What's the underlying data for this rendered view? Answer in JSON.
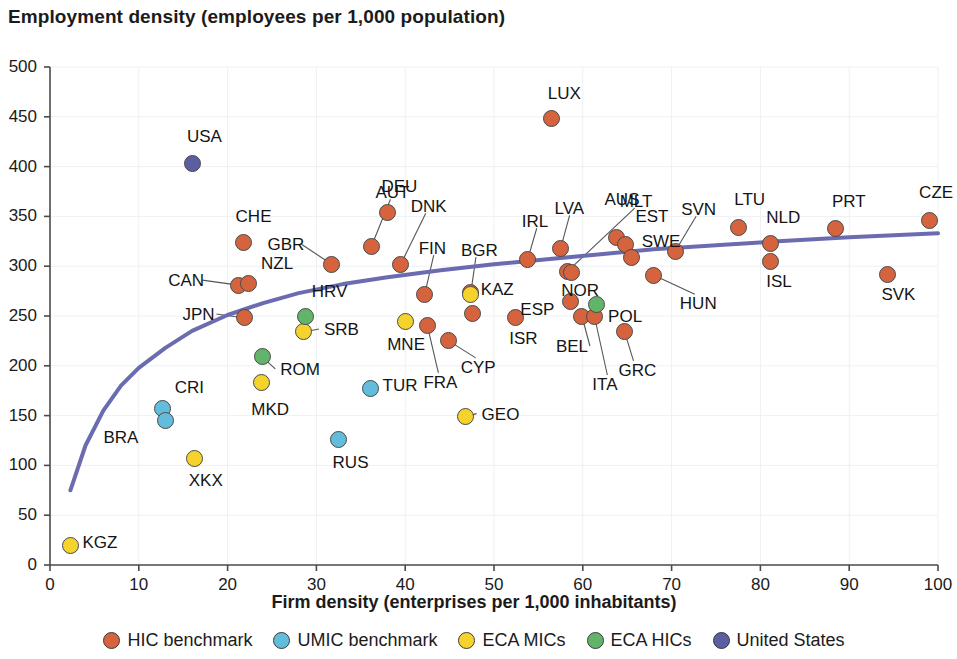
{
  "chart_data": {
    "type": "scatter",
    "title": "Employment density (employees per 1,000 population)",
    "xlabel": "Firm density (enterprises per 1,000 inhabitants)",
    "ylabel": "Employment density (employees per 1,000 population)",
    "xlim": [
      0,
      100
    ],
    "ylim": [
      0,
      500
    ],
    "xticks": [
      0,
      10,
      20,
      30,
      40,
      50,
      60,
      70,
      80,
      90,
      100
    ],
    "yticks": [
      0,
      50,
      100,
      150,
      200,
      250,
      300,
      350,
      400,
      450,
      500
    ],
    "grid": true,
    "legend_position": "bottom",
    "legend": [
      {
        "name": "HIC benchmark",
        "color": "#d4633e"
      },
      {
        "name": "UMIC benchmark",
        "color": "#62bcdc"
      },
      {
        "name": "ECA MICs",
        "color": "#f5d32c"
      },
      {
        "name": "ECA HICs",
        "color": "#62b46a"
      },
      {
        "name": "United States",
        "color": "#5b5ea0"
      }
    ],
    "trendline": {
      "name": "fitted logarithmic trend",
      "color": "#6b6cb0",
      "points": [
        [
          2.3,
          75
        ],
        [
          4,
          120
        ],
        [
          6,
          155
        ],
        [
          8,
          180
        ],
        [
          10,
          198
        ],
        [
          13,
          218
        ],
        [
          16,
          235
        ],
        [
          20,
          251
        ],
        [
          24,
          263
        ],
        [
          28,
          273
        ],
        [
          33,
          282
        ],
        [
          38,
          289
        ],
        [
          44,
          296
        ],
        [
          50,
          302
        ],
        [
          56,
          307
        ],
        [
          62,
          312
        ],
        [
          68,
          317
        ],
        [
          75,
          321
        ],
        [
          82,
          325
        ],
        [
          90,
          329
        ],
        [
          100,
          333
        ]
      ]
    },
    "series": [
      {
        "name": "HIC benchmark",
        "color": "#d4633e",
        "points": [
          {
            "code": "CHE",
            "x": 21.8,
            "y": 324,
            "label_dx": -8,
            "label_dy": -26,
            "leader": false
          },
          {
            "code": "DEU",
            "x": 38.0,
            "y": 354,
            "label_dx": -6,
            "label_dy": -26,
            "leader": false
          },
          {
            "code": "AUT",
            "x": 36.2,
            "y": 320,
            "label_dx": 4,
            "label_dy": -54,
            "leader": true
          },
          {
            "code": "GBR",
            "x": 31.7,
            "y": 302,
            "label_dx": -64,
            "label_dy": -20,
            "leader": true
          },
          {
            "code": "DNK",
            "x": 39.5,
            "y": 302,
            "label_dx": 10,
            "label_dy": -58,
            "leader": true
          },
          {
            "code": "CAN",
            "x": 21.2,
            "y": 281,
            "label_dx": -70,
            "label_dy": -5,
            "leader": true
          },
          {
            "code": "NZL",
            "x": 22.3,
            "y": 283,
            "label_dx": 13,
            "label_dy": -20,
            "leader": false
          },
          {
            "code": "JPN",
            "x": 21.9,
            "y": 248,
            "label_dx": -62,
            "label_dy": -4,
            "leader": true
          },
          {
            "code": "FIN",
            "x": 42.2,
            "y": 272,
            "label_dx": -6,
            "label_dy": -46,
            "leader": true
          },
          {
            "code": "LUX",
            "x": 56.5,
            "y": 448,
            "label_dx": -4,
            "label_dy": -26,
            "leader": false
          },
          {
            "code": "IRL",
            "x": 53.8,
            "y": 307,
            "label_dx": -6,
            "label_dy": -38,
            "leader": true
          },
          {
            "code": "LVA",
            "x": 57.5,
            "y": 318,
            "label_dx": -6,
            "label_dy": -40,
            "leader": true
          },
          {
            "code": "MLT",
            "x": 58.3,
            "y": 295,
            "label_dx": 52,
            "label_dy": -70,
            "leader": true
          },
          {
            "code": "BGR",
            "x": 47.4,
            "y": 274,
            "label_dx": -10,
            "label_dy": -42,
            "leader": true
          },
          {
            "code": "AUS",
            "x": 63.8,
            "y": 329,
            "label_dx": -12,
            "label_dy": -38,
            "leader": false
          },
          {
            "code": "EST",
            "x": 64.8,
            "y": 322,
            "label_dx": 10,
            "label_dy": -28,
            "leader": false
          },
          {
            "code": "SWE",
            "x": 65.5,
            "y": 309,
            "label_dx": 10,
            "label_dy": -16,
            "leader": false
          },
          {
            "code": "SVN",
            "x": 70.4,
            "y": 315,
            "label_dx": 6,
            "label_dy": -42,
            "leader": true
          },
          {
            "code": "NOR",
            "x": 58.7,
            "y": 294,
            "label_dx": -10,
            "label_dy": 18,
            "leader": false
          },
          {
            "code": "LTU",
            "x": 77.5,
            "y": 339,
            "label_dx": -4,
            "label_dy": -28,
            "leader": false
          },
          {
            "code": "NLD",
            "x": 81.1,
            "y": 323,
            "label_dx": -4,
            "label_dy": -26,
            "leader": false
          },
          {
            "code": "ISL",
            "x": 81.1,
            "y": 305,
            "label_dx": -4,
            "label_dy": 20,
            "leader": false
          },
          {
            "code": "PRT",
            "x": 88.5,
            "y": 338,
            "label_dx": -4,
            "label_dy": -27,
            "leader": false
          },
          {
            "code": "CZE",
            "x": 99.0,
            "y": 346,
            "label_dx": -10,
            "label_dy": -28,
            "leader": false
          },
          {
            "code": "SVK",
            "x": 94.3,
            "y": 292,
            "label_dx": -6,
            "label_dy": 20,
            "leader": false
          },
          {
            "code": "HUN",
            "x": 68.0,
            "y": 291,
            "label_dx": 26,
            "label_dy": 28,
            "leader": true
          },
          {
            "code": "KAZ",
            "x": 47.6,
            "y": 253,
            "label_dx": 8,
            "label_dy": -24,
            "leader": false
          },
          {
            "code": "ISR",
            "x": 52.4,
            "y": 248,
            "label_dx": -6,
            "label_dy": 20,
            "leader": false
          },
          {
            "code": "ESP",
            "x": 58.6,
            "y": 265,
            "label_dx": -50,
            "label_dy": 8,
            "leader": false
          },
          {
            "code": "BEL",
            "x": 59.9,
            "y": 250,
            "label_dx": -26,
            "label_dy": 30,
            "leader": true
          },
          {
            "code": "ITA",
            "x": 61.3,
            "y": 250,
            "label_dx": -2,
            "label_dy": 68,
            "leader": true
          },
          {
            "code": "GRC",
            "x": 64.7,
            "y": 234,
            "label_dx": -6,
            "label_dy": 38,
            "leader": true
          },
          {
            "code": "FRA",
            "x": 42.5,
            "y": 240,
            "label_dx": -4,
            "label_dy": 56,
            "leader": true
          },
          {
            "code": "CYP",
            "x": 44.9,
            "y": 225,
            "label_dx": 12,
            "label_dy": 26,
            "leader": true
          }
        ]
      },
      {
        "name": "UMIC benchmark",
        "color": "#62bcdc",
        "points": [
          {
            "code": "CRI",
            "x": 12.7,
            "y": 157,
            "label_dx": 12,
            "label_dy": -22,
            "leader": false
          },
          {
            "code": "BRA",
            "x": 13.0,
            "y": 145,
            "label_dx": -62,
            "label_dy": 16,
            "leader": false
          },
          {
            "code": "TUR",
            "x": 36.1,
            "y": 177,
            "label_dx": 12,
            "label_dy": -4,
            "leader": false
          },
          {
            "code": "RUS",
            "x": 32.5,
            "y": 126,
            "label_dx": -6,
            "label_dy": 22,
            "leader": false
          }
        ]
      },
      {
        "name": "ECA MICs",
        "color": "#f5d32c",
        "points": [
          {
            "code": "KGZ",
            "x": 2.3,
            "y": 20,
            "label_dx": 12,
            "label_dy": -3,
            "leader": false
          },
          {
            "code": "XKX",
            "x": 16.3,
            "y": 107,
            "label_dx": -6,
            "label_dy": 22,
            "leader": false
          },
          {
            "code": "MKD",
            "x": 23.8,
            "y": 183,
            "label_dx": -10,
            "label_dy": 26,
            "leader": false
          },
          {
            "code": "SRB",
            "x": 28.6,
            "y": 234,
            "label_dx": 20,
            "label_dy": -3,
            "leader": true
          },
          {
            "code": "MNE",
            "x": 40.0,
            "y": 244,
            "label_dx": -18,
            "label_dy": 22,
            "leader": false
          },
          {
            "code": "GEO",
            "x": 46.8,
            "y": 149,
            "label_dx": 16,
            "label_dy": -3,
            "leader": true
          },
          {
            "code": "KAZ2",
            "x": 47.3,
            "y": 272,
            "label_dx": 0,
            "label_dy": 0,
            "leader": false
          }
        ]
      },
      {
        "name": "ECA HICs",
        "color": "#62b46a",
        "points": [
          {
            "code": "ROM",
            "x": 23.9,
            "y": 209,
            "label_dx": 18,
            "label_dy": 12,
            "leader": true
          },
          {
            "code": "HRV",
            "x": 28.8,
            "y": 249,
            "label_dx": 6,
            "label_dy": -26,
            "leader": false
          },
          {
            "code": "POL",
            "x": 61.5,
            "y": 262,
            "label_dx": 12,
            "label_dy": 12,
            "leader": false
          }
        ]
      },
      {
        "name": "United States",
        "color": "#5b5ea0",
        "points": [
          {
            "code": "USA",
            "x": 16.1,
            "y": 403,
            "label_dx": -6,
            "label_dy": -28,
            "leader": false
          }
        ]
      }
    ]
  }
}
